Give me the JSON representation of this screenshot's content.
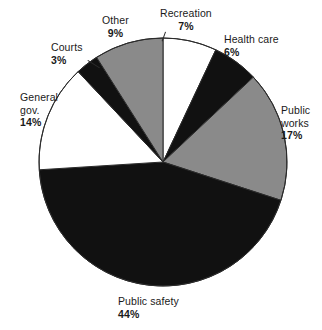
{
  "chart_data": {
    "type": "pie",
    "title": "",
    "subtitle": "",
    "xlabel": "",
    "ylabel": "",
    "legend_position": "none",
    "grid": false,
    "units": "percent",
    "start_angle_deg": 0,
    "direction": "clockwise",
    "center": {
      "x": 163,
      "y": 162
    },
    "radius": 124,
    "categories": [
      "Recreation",
      "Health care",
      "Public works",
      "Public safety",
      "General gov.",
      "Courts",
      "Other"
    ],
    "values": [
      7,
      6,
      17,
      44,
      14,
      3,
      9
    ],
    "slices": [
      {
        "label": "Recreation",
        "value": 7,
        "value_label": "7%",
        "fill": "#ffffff",
        "stroke": "#2b2b2b",
        "start_deg": 0,
        "end_deg": 25.2
      },
      {
        "label": "Health care",
        "value": 6,
        "value_label": "6%",
        "fill": "#111111",
        "stroke": "#2b2b2b",
        "start_deg": 25.2,
        "end_deg": 46.8
      },
      {
        "label": "Public works",
        "value": 17,
        "value_label": "17%",
        "fill": "#8a8a8a",
        "stroke": "#2b2b2b",
        "start_deg": 46.8,
        "end_deg": 108.0
      },
      {
        "label": "Public safety",
        "value": 44,
        "value_label": "44%",
        "fill": "#111111",
        "stroke": "#2b2b2b",
        "start_deg": 108.0,
        "end_deg": 266.4
      },
      {
        "label": "General gov.",
        "value": 14,
        "value_label": "14%",
        "fill": "#ffffff",
        "stroke": "#2b2b2b",
        "start_deg": 266.4,
        "end_deg": 316.8
      },
      {
        "label": "Courts",
        "value": 3,
        "value_label": "3%",
        "fill": "#111111",
        "stroke": "#2b2b2b",
        "start_deg": 316.8,
        "end_deg": 327.6
      },
      {
        "label": "Other",
        "value": 9,
        "value_label": "9%",
        "fill": "#8a8a8a",
        "stroke": "#2b2b2b",
        "start_deg": 327.6,
        "end_deg": 360.0
      }
    ],
    "colors": {
      "black": "#111111",
      "gray": "#8a8a8a",
      "white": "#ffffff",
      "outline": "#2b2b2b",
      "text": "#1a1a1a",
      "background": "#ffffff"
    }
  },
  "labels": {
    "recreation": {
      "name": "Recreation",
      "pct": "7%"
    },
    "health_care": {
      "name": "Health care",
      "pct": "6%"
    },
    "public_works": {
      "name_line1": "Public",
      "name_line2": "works",
      "pct": "17%"
    },
    "public_safety": {
      "name": "Public safety",
      "pct": "44%"
    },
    "general_gov": {
      "name_line1": "General",
      "name_line2": "gov.",
      "pct": "14%"
    },
    "courts": {
      "name": "Courts",
      "pct": "3%"
    },
    "other": {
      "name": "Other",
      "pct": "9%"
    }
  }
}
